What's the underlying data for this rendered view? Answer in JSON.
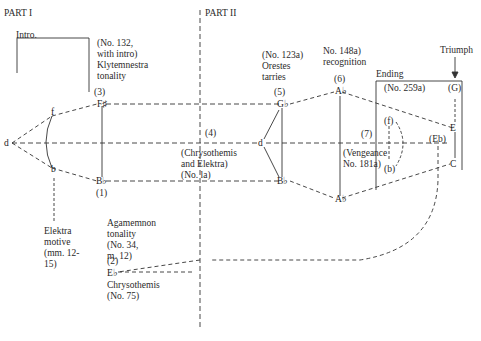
{
  "parts": {
    "part1": "PART I",
    "part2": "PART II"
  },
  "sections": {
    "intro": "Intro.",
    "ending": "Ending"
  },
  "annotations": {
    "n3": "(No. 132,\nwith intro)\nKlytemnestra\ntonality",
    "n3_num": "(3)",
    "n5": "(No. 123a)\nOrestes\ntarries",
    "n5_num": "(5)",
    "n6": "No. 148a)\nrecognition",
    "n6_num": "(6)",
    "triumph": "Triumph",
    "ending_no": "(No. 259a)",
    "ending_G": "(G)",
    "n4_num": "(4)",
    "n4": "(Chrysothemis\nand Elektra)\n(No. la)",
    "n7_num": "(7)",
    "n7": "(Vengeance\nNo. 181a)",
    "f_paren": "(f)",
    "b_paren": "(b)",
    "eb": "(Eb)",
    "elektra": "Elektra\nmotive\n(mm. 12-\n15)",
    "n1_num": "(1)",
    "agamemnon": "Agamemnon\ntonality\n(No. 34,\nm. 12)",
    "n2_num": "(2)",
    "chrysothemis": "Chrysothemis\n(No. 75)"
  },
  "nodes": {
    "d_left": "d",
    "f_left": "f",
    "b_left": "b",
    "F": "F♯",
    "Bb1": "B♭",
    "G5": "G♭",
    "d_mid": "d",
    "Bb2": "B♭",
    "A6": "A♭",
    "Ab": "A♭",
    "E": "E",
    "C": "C",
    "Eb2": "E♭"
  },
  "colors": {
    "line": "#333333",
    "text": "#2a2a2a"
  }
}
